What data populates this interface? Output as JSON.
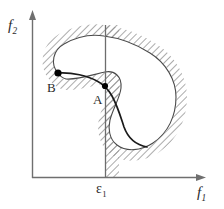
{
  "figure": {
    "domain": "diagram",
    "background_color": "#ffffff",
    "width": 224,
    "height": 209
  },
  "axes": {
    "y_label_main": "f",
    "y_label_sub": "2",
    "x_label_main": "f",
    "x_label_sub": "1",
    "axis_color": "#6f6f6f",
    "origin": {
      "x": 32,
      "y": 178
    },
    "x_axis_end": {
      "x": 205,
      "y": 178
    },
    "y_axis_end": {
      "x": 33,
      "y": 12
    }
  },
  "constraint": {
    "label_main": "ε",
    "label_sub": "1",
    "line_color": "#6d6d6d",
    "x_position": 105,
    "y_top": 25,
    "y_bottom": 178,
    "hatch_band_width": 13,
    "hatch_side": "right"
  },
  "points": [
    {
      "name": "A",
      "label": "A",
      "cx": 105,
      "cy": 86,
      "radius": 3.1,
      "color": "#000000",
      "label_position": "below-left"
    },
    {
      "name": "B",
      "label": "B",
      "cx": 58,
      "cy": 73,
      "radius": 3.6,
      "color": "#000000",
      "label_position": "below-left"
    }
  ],
  "region": {
    "name": "feasible-objective-region",
    "outline_color": "#4a4a4a",
    "hatch_color": "#8a8a8a",
    "hatch_side": "outside",
    "hatch_angle_deg": 45,
    "shape": "kidney"
  },
  "pareto_front": {
    "name": "pareto-front-curve",
    "color": "#1a1a1a",
    "stroke_width": 1.7,
    "from_point": "B",
    "through_point": "A"
  }
}
